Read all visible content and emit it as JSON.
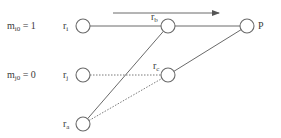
{
  "diagram": {
    "type": "network",
    "arrow": {
      "x1": 113,
      "y1": 13,
      "x2": 219,
      "y2": 13,
      "direction": "right"
    },
    "row_labels": [
      {
        "id": "mi0",
        "base": "m",
        "sub": "i0",
        "rest": " = 1",
        "x": 7,
        "y": 29
      },
      {
        "id": "mj0",
        "base": "m",
        "sub": "j0",
        "rest": " = 0",
        "x": 7,
        "y": 78
      }
    ],
    "nodes": [
      {
        "id": "ri",
        "base": "r",
        "sub": "i",
        "cx": 83,
        "cy": 26,
        "r": 7,
        "label_x": 63,
        "label_y": 29
      },
      {
        "id": "rj",
        "base": "r",
        "sub": "j",
        "cx": 83,
        "cy": 75,
        "r": 7,
        "label_x": 63,
        "label_y": 78
      },
      {
        "id": "ra",
        "base": "r",
        "sub": "a",
        "cx": 83,
        "cy": 124,
        "r": 7,
        "label_x": 63,
        "label_y": 127
      },
      {
        "id": "rb",
        "base": "r",
        "sub": "b",
        "cx": 168,
        "cy": 26,
        "r": 7,
        "label_x": 151,
        "label_y": 20
      },
      {
        "id": "rc",
        "base": "r",
        "sub": "c",
        "cx": 168,
        "cy": 75,
        "r": 7,
        "label_x": 153,
        "label_y": 69
      },
      {
        "id": "P",
        "base": "P",
        "sub": "",
        "cx": 247,
        "cy": 26,
        "r": 7,
        "label_x": 258,
        "label_y": 29
      }
    ],
    "edges": [
      {
        "from": "ri",
        "to": "rb",
        "style": "solid"
      },
      {
        "from": "rb",
        "to": "P",
        "style": "solid"
      },
      {
        "from": "ra",
        "to": "rb",
        "style": "solid"
      },
      {
        "from": "rc",
        "to": "P",
        "style": "solid"
      },
      {
        "from": "rj",
        "to": "rc",
        "style": "dotted"
      },
      {
        "from": "ra",
        "to": "rc",
        "style": "dotted"
      }
    ],
    "colors": {
      "stroke": "#6a6a6a",
      "text": "#3a3a3a",
      "background": "#ffffff"
    }
  }
}
